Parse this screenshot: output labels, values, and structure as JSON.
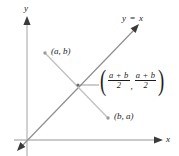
{
  "figure": {
    "axes": {
      "y_label": "y",
      "x_label": "x"
    },
    "line": {
      "label": "y = x",
      "equation_slope": 1,
      "equation_intercept": 0
    },
    "points": [
      {
        "name": "point-ab",
        "label": "(a, b)",
        "x_px": 45,
        "y_px": 53
      },
      {
        "name": "point-ba",
        "label": "(b, a)",
        "x_px": 108,
        "y_px": 118
      }
    ],
    "midpoint": {
      "open_paren": "(",
      "close_paren": ")",
      "comma": ",",
      "first_numerator": "a + b",
      "first_denominator": "2",
      "second_numerator": "a + b",
      "second_denominator": "2",
      "x_px": 78,
      "y_px": 85
    },
    "colors": {
      "axis": "#b9b9b9",
      "line_yx": "#8f8f8f",
      "segment": "#c2c2c2",
      "arrowhead": "#3a3a3a",
      "text": "#1c1c1c",
      "point_marker": "#9a9a9a",
      "background": "#ffffff"
    }
  }
}
